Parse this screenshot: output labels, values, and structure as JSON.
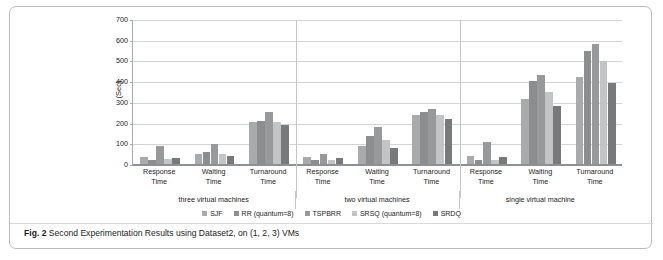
{
  "figure": {
    "caption_label": "Fig. 2",
    "caption_text": "Second Experimentation Results using Dataset2, on (1, 2, 3) VMs"
  },
  "chart_data": {
    "type": "bar",
    "title": "",
    "subtitle": "",
    "xlabel": "",
    "ylabel": "(Sec)",
    "ylim": [
      0,
      700
    ],
    "yticks": [
      0,
      100,
      200,
      300,
      400,
      500,
      600,
      700
    ],
    "ytick_labels": [
      "0",
      "100",
      "200",
      "300",
      "400",
      "500",
      "600",
      "700"
    ],
    "grid": true,
    "legend_position": "bottom",
    "orientation": "vertical",
    "group_labels": [
      "three virtual machines",
      "two virtual machines",
      "single virtual machine"
    ],
    "categories": [
      "Response Time",
      "Waiting Time",
      "Turnaround Time",
      "Response Time",
      "Waiting Time",
      "Turnaround Time",
      "Response Time",
      "Waiting Time",
      "Turnaround Time"
    ],
    "series": [
      {
        "name": "SJF",
        "color": "#a9aaac",
        "values": [
          35,
          50,
          205,
          32,
          88,
          235,
          38,
          315,
          418
        ]
      },
      {
        "name": "RR (quantum=8)",
        "color": "#8b8d8f",
        "values": [
          20,
          60,
          210,
          20,
          135,
          250,
          18,
          400,
          548
        ]
      },
      {
        "name": "TSPBRR",
        "color": "#98999b",
        "values": [
          85,
          95,
          250,
          48,
          180,
          268,
          105,
          430,
          578
        ]
      },
      {
        "name": "SRSQ (quantum=8)",
        "color": "#c3c4c6",
        "values": [
          22,
          50,
          205,
          18,
          115,
          235,
          20,
          348,
          498
        ]
      },
      {
        "name": "SRDQ",
        "color": "#77797b",
        "values": [
          30,
          38,
          190,
          30,
          75,
          218,
          35,
          282,
          392
        ]
      }
    ]
  }
}
